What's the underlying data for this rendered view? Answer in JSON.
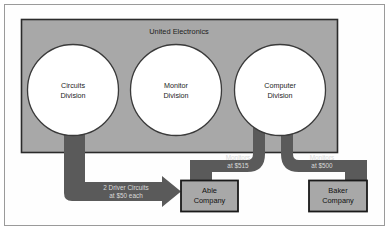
{
  "figure": {
    "name": "united-electronics-transfer-pricing-diagram",
    "parent_company": "United Electronics"
  },
  "colors": {
    "frame_border": "#9a9a9a",
    "page_background": "#ffffff",
    "company_fill": "#a8a8a8",
    "company_border": "#2b2b2b",
    "circle_fill": "#ffffff",
    "circle_border": "#3a3a3a",
    "arrow_fill": "#5a5a5a",
    "arrow_label": "#d9d9d9",
    "box_fill": "#a8a8a8",
    "box_border": "#1a1a1a",
    "text_dark": "#1d1d1d"
  },
  "company": {
    "label": "United Electronics",
    "divisions": [
      {
        "id": "circuits",
        "line1": "Circuits",
        "line2": "Division"
      },
      {
        "id": "monitor",
        "line1": "Monitor",
        "line2": "Division"
      },
      {
        "id": "computer",
        "line1": "Computer",
        "line2": "Division"
      }
    ]
  },
  "customers": [
    {
      "id": "able",
      "line1": "Able",
      "line2": "Company"
    },
    {
      "id": "baker",
      "line1": "Baker",
      "line2": "Company"
    }
  ],
  "flows": [
    {
      "id": "circuits-to-able",
      "from": "Circuits Division",
      "to": "Able Company",
      "line1": "2 Driver Circuits",
      "line2": "at $50 each"
    },
    {
      "id": "computer-to-able",
      "from": "Computer Division",
      "to": "Able Company",
      "line1": "Monitors",
      "line2": "at $515"
    },
    {
      "id": "computer-to-baker",
      "from": "Computer Division",
      "to": "Baker Company",
      "line1": "Monitors",
      "line2": "at $500"
    }
  ]
}
